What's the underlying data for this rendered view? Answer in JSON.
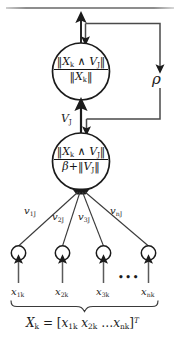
{
  "figure": {
    "type": "neural-network-node-diagram",
    "title_rule": true,
    "background_color": "#ffffff",
    "ink_color": "#1c1c1c"
  },
  "nodes": {
    "top": {
      "name": "match-node",
      "formula_numerator": "‖X",
      "numerator": {
        "open": "‖",
        "x_sym": "X",
        "x_sub": "k",
        "wedge": "∧",
        "v_sym": "V",
        "v_sub": "J",
        "close": "‖"
      },
      "denominator": {
        "open": "‖",
        "x_sym": "X",
        "x_sub": "k",
        "close": "‖"
      }
    },
    "bottom": {
      "name": "choice-node",
      "numerator": {
        "open": "‖",
        "x_sym": "X",
        "x_sub": "k",
        "wedge": "∧",
        "v_sym": "V",
        "v_sub": "J",
        "close": "‖"
      },
      "denominator": {
        "beta": "β",
        "plus": "+",
        "open": "‖",
        "v_sym": "V",
        "v_sub": "J",
        "close": "‖"
      }
    }
  },
  "labels": {
    "vigilance": {
      "symbol": "ρ"
    },
    "interlayer": {
      "symbol": "V",
      "sub": "J"
    }
  },
  "weights": [
    {
      "symbol": "v",
      "sub": "1J"
    },
    {
      "symbol": "v",
      "sub": "2J"
    },
    {
      "symbol": "v",
      "sub": "3J"
    },
    {
      "symbol": "v",
      "sub": "nJ"
    }
  ],
  "inputs": [
    {
      "symbol": "x",
      "sub": "1k"
    },
    {
      "symbol": "x",
      "sub": "2k"
    },
    {
      "symbol": "x",
      "sub": "3k"
    },
    {
      "symbol": "x",
      "sub": "nk"
    }
  ],
  "ellipsis": "•••",
  "equation": {
    "lhs_sym": "X",
    "lhs_sub": "k",
    "equals": "=",
    "open_bracket": "[",
    "terms": "x",
    "t1_sub": "1k",
    "t2_sym": "x",
    "t2_sub": "2k",
    "dots": "…",
    "t3_sym": "x",
    "t3_sub": "nk",
    "close_bracket": "]",
    "transpose": "T"
  }
}
